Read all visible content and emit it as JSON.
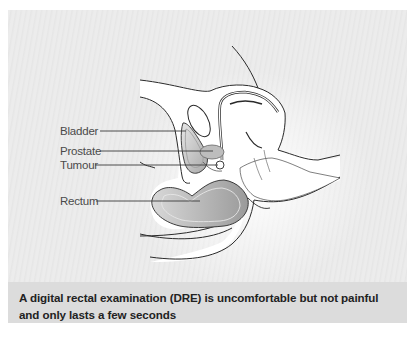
{
  "figure": {
    "labels": [
      {
        "id": "bladder",
        "text": "Bladder"
      },
      {
        "id": "prostate",
        "text": "Prostate"
      },
      {
        "id": "tumour",
        "text": "Tumour"
      },
      {
        "id": "rectum",
        "text": "Rectum"
      }
    ],
    "caption": "A digital rectal examination (DRE) is uncomfortable but not painful and only lasts a few seconds"
  },
  "colors": {
    "panel_bg": "#ececec",
    "caption_bg": "#dcdcdc",
    "organ_fill": "#c8c8c8",
    "outline": "#2a2a2a"
  }
}
